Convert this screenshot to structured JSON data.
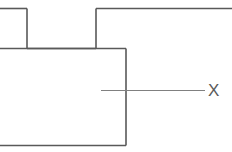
{
  "figure": {
    "background_color": "#ffffff",
    "width": 232,
    "height": 152
  },
  "style": {
    "outline_color": "#595959",
    "outline_width": 1.6,
    "leader_color": "#808080",
    "leader_width": 1.1,
    "label_color": "#5a5a5a",
    "label_font_size": "17px"
  },
  "geometry": {
    "outline_segments": [
      {
        "name": "top-left-horizontal",
        "x1": 0,
        "y1": 8.5,
        "x2": 27,
        "y2": 8.5
      },
      {
        "name": "left-step-vertical",
        "x1": 27,
        "y1": 8.5,
        "x2": 27,
        "y2": 48.5
      },
      {
        "name": "notch-floor-horizontal",
        "x1": 27,
        "y1": 48.5,
        "x2": 96,
        "y2": 48.5
      },
      {
        "name": "right-step-vertical",
        "x1": 96,
        "y1": 48.5,
        "x2": 96,
        "y2": 8.5
      },
      {
        "name": "top-right-horizontal",
        "x1": 96,
        "y1": 8.5,
        "x2": 232,
        "y2": 8.5
      },
      {
        "name": "body-top-horizontal",
        "x1": 0,
        "y1": 48.5,
        "x2": 126,
        "y2": 48.5
      },
      {
        "name": "body-right-vertical",
        "x1": 126,
        "y1": 48.5,
        "x2": 126,
        "y2": 145.5
      },
      {
        "name": "body-bottom-horizontal",
        "x1": 126,
        "y1": 145.5,
        "x2": 0,
        "y2": 145.5
      }
    ],
    "leader_line": {
      "name": "callout-leader",
      "x1": 101,
      "y1": 90.5,
      "x2": 205,
      "y2": 90.5
    }
  },
  "annotations": {
    "callouts": [
      {
        "name": "dimension-label-x",
        "text": "X",
        "x": 208,
        "y": 82
      }
    ]
  }
}
